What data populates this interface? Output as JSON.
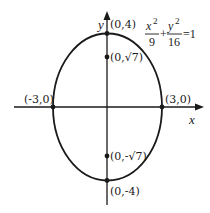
{
  "diagram": {
    "type": "ellipse-plot",
    "equation": {
      "term1_num": "x",
      "term1_exp": "2",
      "term1_den": "9",
      "plus": "+",
      "term2_num": "y",
      "term2_exp": "2",
      "term2_den": "16",
      "rhs": "=1"
    },
    "axes": {
      "x_label": "x",
      "y_label": "y"
    },
    "points": {
      "top_vertex": "(0,4)",
      "bottom_vertex": "(0,-4)",
      "left_covertex": "(-3,0)",
      "right_covertex": "(3,0)",
      "focus_top": "(0,√7)",
      "focus_bottom": "(0,-√7)"
    },
    "colors": {
      "stroke": "#1a1a1a",
      "background": "#ffffff"
    }
  }
}
